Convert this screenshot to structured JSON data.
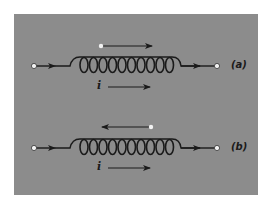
{
  "figure": {
    "background_color": "#8c8c8c",
    "line_color": "#1a1a1a",
    "terminal_color": "#f2f2f2",
    "subfigures": [
      {
        "id": "a",
        "label": "(a)",
        "coil_turns": 10,
        "current_label": "i",
        "current_direction": "right",
        "field_arrow_direction": "right",
        "input_arrow_direction": "right",
        "output_arrow_direction": "right"
      },
      {
        "id": "b",
        "label": "(b)",
        "coil_turns": 10,
        "current_label": "i",
        "current_direction": "right",
        "field_arrow_direction": "left",
        "input_arrow_direction": "right",
        "output_arrow_direction": "right"
      }
    ]
  }
}
